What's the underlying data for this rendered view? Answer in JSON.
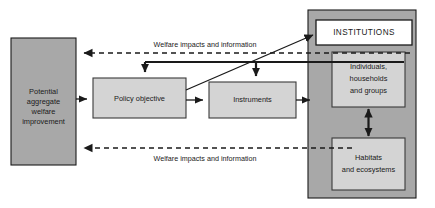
{
  "diagram": {
    "colors": {
      "region": "#a8a8a8",
      "node": "#d4d4d4",
      "node_white": "#ffffff",
      "line": "#1a1a1a",
      "background": "#ffffff"
    },
    "nodes": {
      "potential_welfare": {
        "label_lines": [
          "Potential",
          "aggregate",
          "welfare",
          "improvement"
        ],
        "line1": "Potential",
        "line2": "aggregate",
        "line3": "welfare",
        "line4": "improvement"
      },
      "policy_objective": {
        "label": "Policy objective"
      },
      "instruments": {
        "label": "Instruments"
      },
      "institutions": {
        "label": "INSTITUTIONS"
      },
      "individuals": {
        "label_lines": [
          "Individuals,",
          "households",
          "and groups"
        ],
        "line1": "Individuals,",
        "line2": "households",
        "line3": "and groups"
      },
      "habitats": {
        "label_lines": [
          "Habitats",
          "and ecosystems"
        ],
        "line1": "Habitats",
        "line2": "and ecosystems"
      }
    },
    "edges": {
      "welfare_top": {
        "label": "Welfare impacts and information",
        "style": "dashed",
        "direction": "left"
      },
      "welfare_bottom": {
        "label": "Welfare impacts and information",
        "style": "dashed",
        "direction": "left"
      },
      "welfare_to_policy": {
        "style": "solid",
        "direction": "right"
      },
      "policy_to_instruments": {
        "style": "solid",
        "direction": "right"
      },
      "instruments_to_region": {
        "style": "solid",
        "direction": "right"
      },
      "feedback_to_policy": {
        "style": "solid",
        "direction": "down"
      },
      "feedback_to_instruments": {
        "style": "solid",
        "direction": "down"
      },
      "diagonal_to_institutions": {
        "style": "solid",
        "direction": "up-right"
      },
      "individuals_habitats": {
        "style": "solid",
        "direction": "both"
      }
    }
  }
}
